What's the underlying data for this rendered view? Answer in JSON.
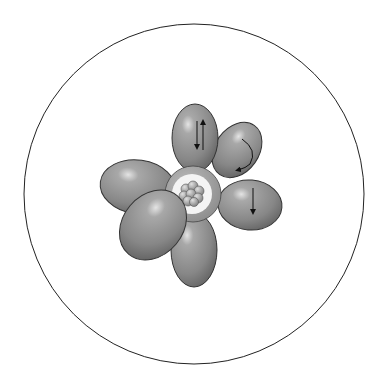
{
  "diagram": {
    "lobe_count": 6,
    "colors": {
      "background": "#ffffff",
      "boundary": "#222222",
      "lobe_fill": "#8a8a8a",
      "lobe_highlight": "#d8d8d8",
      "lobe_shadow": "#5e5e5e",
      "core_ring": "#9a9a9a",
      "core_gap": "#f4f4f4",
      "nucleus": "#a8a8a8",
      "arrow": "#111111"
    },
    "lobes": [
      {
        "name": "lobe-top",
        "arrows": "paired-up-down"
      },
      {
        "name": "lobe-upper-right",
        "arrows": "curved"
      },
      {
        "name": "lobe-right",
        "arrows": "single-down"
      },
      {
        "name": "lobe-bottom",
        "arrows": "none"
      },
      {
        "name": "lobe-lower-left",
        "arrows": "none"
      },
      {
        "name": "lobe-left",
        "arrows": "none"
      }
    ]
  }
}
